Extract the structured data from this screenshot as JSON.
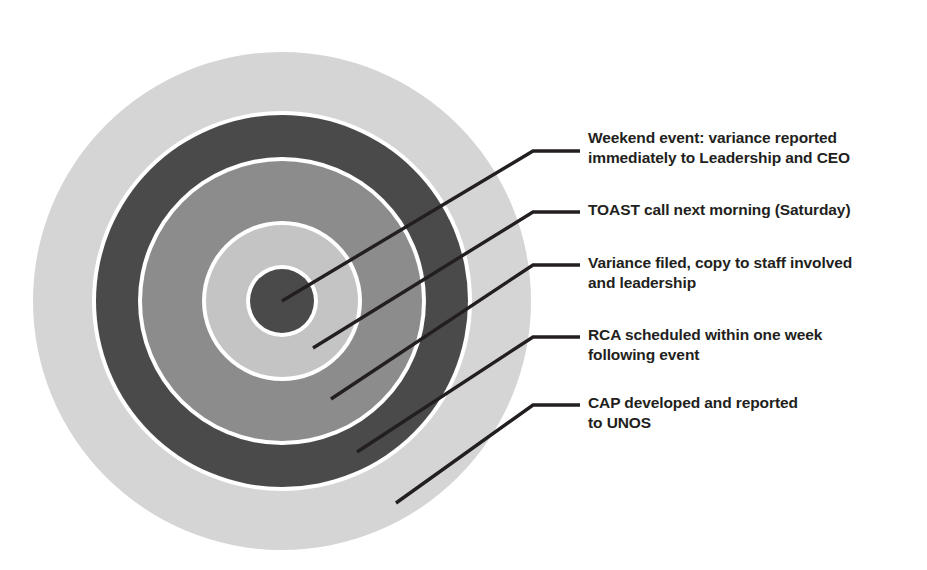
{
  "diagram": {
    "type": "concentric-target",
    "title_visible": false,
    "center": {
      "x": 282,
      "y": 301
    },
    "colors": {
      "ring_dark": "#4a4a4a",
      "ring_medium": "#8c8c8c",
      "ring_light": "#b7b7b7",
      "ring_outer_light": "#d5d5d5",
      "separator": "#ffffff",
      "leader_line": "#231f20",
      "text": "#231f20",
      "background": "#ffffff"
    },
    "rings": [
      {
        "index": 0,
        "name": "outer-ring",
        "radius": 249,
        "fill": "#d5d5d5"
      },
      {
        "index": 1,
        "name": "fourth-ring",
        "radius": 186,
        "fill": "#4a4a4a"
      },
      {
        "index": 2,
        "name": "third-ring",
        "radius": 140,
        "fill": "#8c8c8c"
      },
      {
        "index": 3,
        "name": "second-ring",
        "radius": 76,
        "fill": "#c4c4c4"
      },
      {
        "index": 4,
        "name": "bullseye-center",
        "radius": 32,
        "fill": "#4a4a4a"
      }
    ],
    "callouts": [
      {
        "id": "callout-1",
        "ring": "bullseye-center",
        "text": "Weekend event: variance reported\nimmediately to Leadership and CEO",
        "leader": {
          "start": {
            "x": 282,
            "y": 301
          },
          "elbow": {
            "x": 533,
            "y": 151
          },
          "end": {
            "x": 580,
            "y": 151
          }
        }
      },
      {
        "id": "callout-2",
        "ring": "second-ring",
        "text": "TOAST call next morning (Saturday)",
        "leader": {
          "start": {
            "x": 313,
            "y": 348
          },
          "elbow": {
            "x": 533,
            "y": 212
          },
          "end": {
            "x": 580,
            "y": 212
          }
        }
      },
      {
        "id": "callout-3",
        "ring": "third-ring",
        "text": "Variance filed, copy to staff involved\nand leadership",
        "leader": {
          "start": {
            "x": 331,
            "y": 399
          },
          "elbow": {
            "x": 533,
            "y": 265
          },
          "end": {
            "x": 580,
            "y": 265
          }
        }
      },
      {
        "id": "callout-4",
        "ring": "fourth-ring",
        "text": "RCA scheduled within one week\nfollowing event",
        "leader": {
          "start": {
            "x": 357,
            "y": 452
          },
          "elbow": {
            "x": 533,
            "y": 337
          },
          "end": {
            "x": 580,
            "y": 337
          }
        }
      },
      {
        "id": "callout-5",
        "ring": "outer-ring",
        "text": "CAP developed and reported\nto UNOS",
        "leader": {
          "start": {
            "x": 396,
            "y": 503
          },
          "elbow": {
            "x": 533,
            "y": 405
          },
          "end": {
            "x": 580,
            "y": 405
          }
        }
      }
    ]
  }
}
